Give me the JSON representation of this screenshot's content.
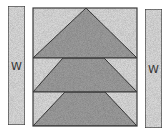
{
  "diagram": {
    "type": "quilt-block",
    "colors": {
      "light_fabric": "#d9d9d9",
      "dark_fabric": "#9c9c9c",
      "outline": "#3a3a3a",
      "background": "#ffffff"
    },
    "left_strip": {
      "label": "W",
      "x": 8,
      "y": 6,
      "width": 17,
      "height": 119
    },
    "right_strip": {
      "label": "W",
      "x": 145,
      "y": 9,
      "width": 17,
      "height": 119
    },
    "center_block": {
      "x": 33,
      "y": 8,
      "width": 104,
      "height": 118,
      "rows": [
        {
          "index": 1,
          "shape": "triangle",
          "top_y": 8,
          "bottom_y": 58,
          "top_left_x": 86,
          "top_right_x": 86
        },
        {
          "index": 2,
          "shape": "trapezoid",
          "top_y": 58,
          "bottom_y": 92,
          "top_left_x": 63,
          "top_right_x": 104
        },
        {
          "index": 3,
          "shape": "trapezoid",
          "top_y": 92,
          "bottom_y": 126,
          "top_left_x": 65,
          "top_right_x": 105
        }
      ]
    }
  }
}
